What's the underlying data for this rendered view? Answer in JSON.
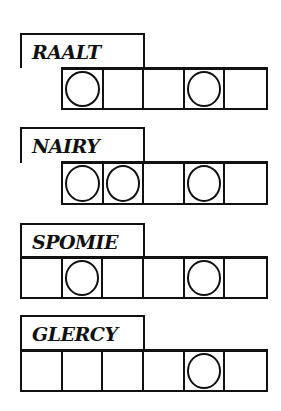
{
  "puzzle": {
    "rows": [
      {
        "scrambled": "RAALT",
        "cell_count": 5,
        "circled": [
          0,
          3
        ]
      },
      {
        "scrambled": "NAIRY",
        "cell_count": 5,
        "circled": [
          0,
          1,
          3
        ]
      },
      {
        "scrambled": "SPOMIE",
        "cell_count": 6,
        "circled": [
          1,
          4
        ]
      },
      {
        "scrambled": "GLERCY",
        "cell_count": 6,
        "circled": [
          4
        ]
      }
    ]
  }
}
